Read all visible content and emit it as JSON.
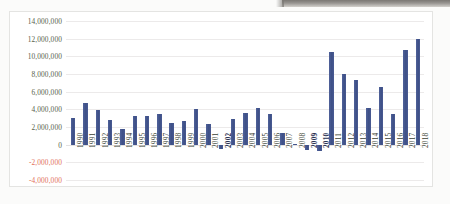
{
  "chart_data": {
    "type": "bar",
    "title": "",
    "subtitle": "",
    "xlabel": "",
    "ylabel": "",
    "legend": [],
    "grid": true,
    "legend_position": "none",
    "ylim": [
      -4000000,
      14000000
    ],
    "ytick_step": 2000000,
    "ytick_labels": [
      "14,000,000",
      "12,000,000",
      "10,000,000",
      "8,000,000",
      "6,000,000",
      "4,000,000",
      "2,000,000",
      "0",
      "-2,000,000",
      "-4,000,000"
    ],
    "ytick_values": [
      14000000,
      12000000,
      10000000,
      8000000,
      6000000,
      4000000,
      2000000,
      0,
      -2000000,
      -4000000
    ],
    "categories": [
      "1990",
      "1991",
      "1992",
      "1993",
      "1994",
      "1995",
      "1996",
      "1997",
      "1998",
      "1999",
      "2000",
      "2001",
      "2002",
      "2003",
      "2004",
      "2005",
      "2006",
      "2007",
      "2008",
      "2009",
      "2010",
      "2011",
      "2012",
      "2013",
      "2014",
      "2015",
      "2016",
      "2017",
      "2018"
    ],
    "values": [
      3050000,
      4700000,
      3950000,
      2820000,
      1800000,
      3200000,
      3270000,
      3470000,
      2420000,
      2700000,
      4050000,
      2300000,
      -520000,
      2950000,
      3560000,
      4150000,
      3520000,
      1330000,
      110000,
      -610000,
      -700000,
      10500000,
      7950000,
      7330000,
      4120000,
      6570000,
      3430000,
      10700000,
      12000000
    ],
    "series_name": "",
    "bar_color": "#44568f",
    "negative_label_color": "#e2705a",
    "axis_label_color": "#595f4a",
    "gridline_color": "#eceaea",
    "plot_background": "#ffffff",
    "page_background": "#fbfbfa"
  }
}
